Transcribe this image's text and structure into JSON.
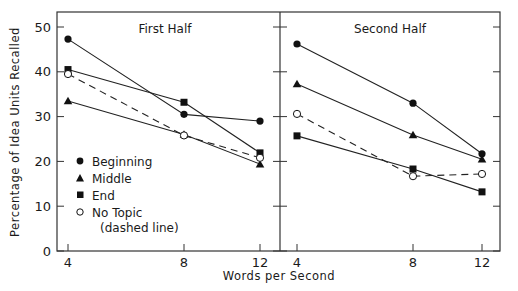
{
  "chart_data": {
    "type": "line",
    "ylabel": "Percentage of Idea Units Recalled",
    "xlabel": "Words per Second",
    "ylim": [
      0,
      50
    ],
    "yticks": [
      0,
      10,
      20,
      30,
      40,
      50
    ],
    "xticks": [
      4,
      8,
      12
    ],
    "grid": false,
    "legend_position": "lower-left inside first panel",
    "legend": [
      {
        "name": "Beginning",
        "marker": "filled-circle",
        "line": "solid"
      },
      {
        "name": "Middle",
        "marker": "filled-triangle",
        "line": "solid"
      },
      {
        "name": "End",
        "marker": "filled-square",
        "line": "solid"
      },
      {
        "name": "No Topic",
        "note": "(dashed line)",
        "marker": "open-circle",
        "line": "dashed"
      }
    ],
    "panels": [
      {
        "title": "First Half",
        "x": [
          4,
          8,
          12
        ],
        "series": [
          {
            "name": "Beginning",
            "values": [
              47.3,
              30.5,
              29.0
            ]
          },
          {
            "name": "Middle",
            "values": [
              33.5,
              26.0,
              19.4
            ]
          },
          {
            "name": "End",
            "values": [
              40.5,
              33.2,
              21.9
            ]
          },
          {
            "name": "No Topic",
            "values": [
              39.5,
              25.8,
              20.8
            ]
          }
        ]
      },
      {
        "title": "Second Half",
        "x": [
          4,
          8,
          12
        ],
        "series": [
          {
            "name": "Beginning",
            "values": [
              46.2,
              33.0,
              21.7
            ]
          },
          {
            "name": "Middle",
            "values": [
              37.3,
              25.9,
              20.5
            ]
          },
          {
            "name": "End",
            "values": [
              25.7,
              18.3,
              13.2
            ]
          },
          {
            "name": "No Topic",
            "values": [
              30.6,
              16.7,
              17.2
            ]
          }
        ]
      }
    ]
  },
  "legend_labels": {
    "beginning": "Beginning",
    "middle": "Middle",
    "end": "End",
    "no_topic": "No Topic",
    "no_topic_note": "(dashed line)"
  },
  "panel_titles": [
    "First Half",
    "Second Half"
  ],
  "axis": {
    "ylabel": "Percentage of Idea Units Recalled",
    "xlabel": "Words per Second",
    "yticks": [
      "0",
      "10",
      "20",
      "30",
      "40",
      "50"
    ],
    "xticks": [
      "4",
      "8",
      "12"
    ]
  }
}
